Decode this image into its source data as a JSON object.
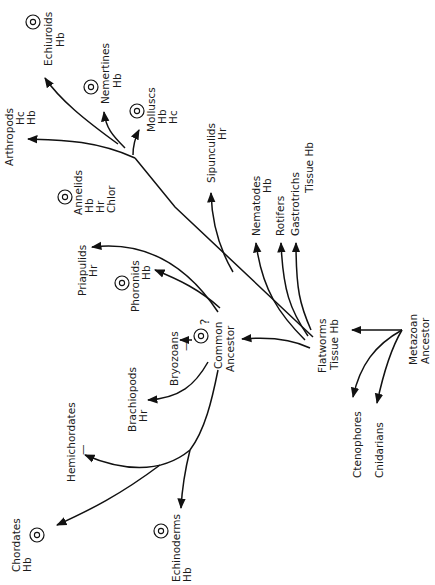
{
  "diagram": {
    "type": "phylogenetic-tree",
    "orientation": "rotated-90-ccw",
    "nodes": {
      "metazoan_ancestor": {
        "line1": "Metazoan",
        "line2": "Ancestor"
      },
      "common_ancestor": {
        "line1": "Common",
        "line2": "Ancestor"
      },
      "flatworms": {
        "name": "Flatworms",
        "pigment": "Tissue  Hb"
      }
    },
    "taxa": {
      "echiuroids": {
        "name": "Echiuroids",
        "pigments": [
          "Hb"
        ],
        "coelom": true
      },
      "nemertines": {
        "name": "Nemertines",
        "pigments": [
          "Hb"
        ],
        "coelom": true
      },
      "molluscs": {
        "name": "Molluscs",
        "pigments": [
          "Hb",
          "Hc"
        ],
        "coelom": true
      },
      "arthropods": {
        "name": "Arthropods",
        "pigments": [
          "Hc",
          "Hb"
        ]
      },
      "annelids": {
        "name": "Annelids",
        "pigments": [
          "Hb",
          "Hr",
          "Chlor"
        ],
        "coelom": true
      },
      "sipunculids": {
        "name": "Sipunculids",
        "pigments": [
          "Hr"
        ]
      },
      "nematodes": {
        "name": "Nematodes",
        "pigments": [
          "Hb"
        ]
      },
      "rotifers": {
        "name": "Rotifers"
      },
      "gastrotrichs": {
        "name": "Gastrotrichs",
        "pigment": "Tissue  Hb"
      },
      "priapulids": {
        "name": "Priapulids",
        "pigments": [
          "Hr"
        ]
      },
      "phoronids": {
        "name": "Phoronids",
        "pigments": [
          "Hb"
        ],
        "coelom": true
      },
      "bryozoans": {
        "name": "Bryozoans",
        "pigments": [
          "—"
        ],
        "coelom": true,
        "mark": "?"
      },
      "brachiopods": {
        "name": "Brachiopods",
        "pigments": [
          "Hr"
        ]
      },
      "hemichordates": {
        "name": "Hemichordates",
        "pigments": [
          "—"
        ]
      },
      "chordates": {
        "name": "Chordates",
        "pigments": [
          "Hb"
        ],
        "coelom": true
      },
      "echinoderms": {
        "name": "Echinoderms",
        "pigments": [
          "Hb"
        ],
        "coelom": true
      },
      "ctenophores": {
        "name": "Ctenophores"
      },
      "cnidarians": {
        "name": "Cnidarians"
      }
    },
    "legend_symbols": {
      "ringed-circle": "coelom symbol (◎)",
      "Hb": "hemoglobin",
      "Hc": "hemocyanin",
      "Hr": "hemerythrin",
      "Chlor": "chlorocruorin"
    }
  }
}
